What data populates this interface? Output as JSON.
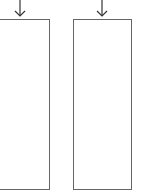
{
  "diagram": {
    "panels": [
      {
        "id": "left",
        "has_arrow": true
      },
      {
        "id": "right",
        "has_arrow": true
      }
    ],
    "stroke_color": "#666666",
    "arrow_color": "#333333"
  }
}
